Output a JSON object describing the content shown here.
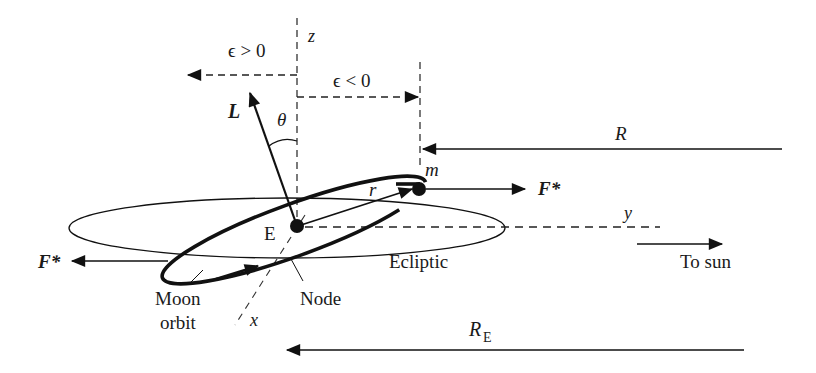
{
  "diagram": {
    "type": "physics-orbit-diagram",
    "labels": {
      "z_axis": "z",
      "y_axis": "y",
      "x_axis": "x",
      "eps_pos": "ϵ > 0",
      "eps_neg": "ϵ < 0",
      "angular_momentum": "L",
      "theta": "θ",
      "mass": "m",
      "radius": "r",
      "earth": "E",
      "force_right": "F*",
      "force_left": "F*",
      "sun_distance": "R",
      "earth_sun_distance": "R",
      "earth_sun_distance_sub": "E",
      "ecliptic": "Ecliptic",
      "to_sun": "To sun",
      "moon_orbit_line1": "Moon",
      "moon_orbit_line2": "orbit",
      "node": "Node"
    },
    "colors": {
      "ink": "#111111",
      "background": "#ffffff"
    }
  }
}
